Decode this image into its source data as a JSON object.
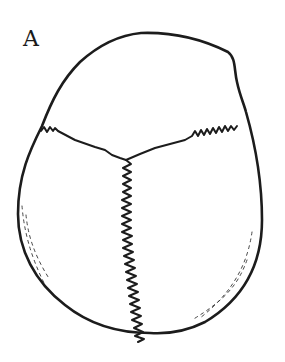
{
  "figure": {
    "panel_label": "A",
    "parts": [
      "outline",
      "coronal-suture",
      "sagittal-suture",
      "shading-left",
      "shading-right"
    ]
  },
  "colors": {
    "ink": "#1c1c1c",
    "background": "#ffffff"
  }
}
